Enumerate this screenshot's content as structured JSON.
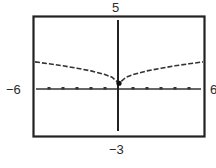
{
  "chart_data": {
    "type": "line",
    "title": "",
    "xlabel": "",
    "ylabel": "",
    "xlim": [
      -6,
      6
    ],
    "ylim": [
      -3,
      5
    ],
    "window_labels": {
      "xmin": "−6",
      "xmax": "6",
      "ymin": "−3",
      "ymax": "5"
    },
    "grid": false,
    "x_ticks_every": 1,
    "series": [
      {
        "name": "curve",
        "style": "dashed",
        "x": [
          -6,
          -5,
          -4,
          -3,
          -2,
          -1,
          -0.5,
          0,
          0.5,
          1,
          2,
          3,
          4,
          5,
          6
        ],
        "y": [
          1.97,
          1.84,
          1.7,
          1.54,
          1.35,
          1.1,
          0.92,
          0.5,
          0.92,
          1.1,
          1.35,
          1.54,
          1.7,
          1.84,
          1.97
        ]
      }
    ],
    "points": [
      {
        "x": 0,
        "y": 0.5,
        "label": ""
      }
    ]
  }
}
